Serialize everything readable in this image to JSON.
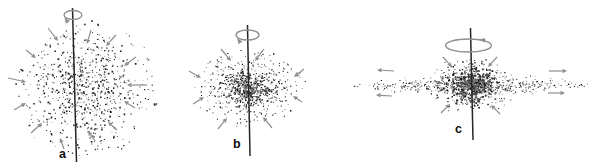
{
  "canvas": {
    "width": 601,
    "height": 168,
    "background": "#ffffff"
  },
  "colors": {
    "particle_dark": "#141414",
    "particle_mid": "#3c3c3c",
    "particle_light": "#757575",
    "arrow": "#8e8e8e",
    "axis": "#262626",
    "label": "#0f0f0f"
  },
  "panels": [
    {
      "label": "a",
      "label_pos": {
        "x": 59,
        "y": 158
      },
      "axis": {
        "x1": 72.5,
        "y1": 8,
        "x2": 76.5,
        "y2": 162
      },
      "rotation": {
        "cx": 73,
        "cy": 15,
        "rx": 9,
        "ry": 4.5,
        "head": {
          "x": 64.5,
          "y": 17.5,
          "rot": 235
        }
      },
      "clusters": [
        {
          "cx": 85,
          "cy": 88,
          "sx": 30,
          "sy": 27,
          "n": 620,
          "rx": 76,
          "ry": 68,
          "smin": 0.7,
          "smax": 1.7
        },
        {
          "cx": 85,
          "cy": 88,
          "sx": 44,
          "sy": 40,
          "n": 240,
          "rx": 77,
          "ry": 69,
          "smin": 0.6,
          "smax": 1.3
        }
      ],
      "infall_arrows": [
        [
          48,
          28,
          58,
          41
        ],
        [
          91,
          30,
          87,
          44
        ],
        [
          116,
          35,
          106,
          46
        ],
        [
          26,
          50,
          36,
          58
        ],
        [
          136,
          57,
          124,
          66
        ],
        [
          8,
          78,
          26,
          82
        ],
        [
          147,
          85,
          127,
          85
        ],
        [
          14,
          110,
          26,
          103
        ],
        [
          135,
          108,
          124,
          101
        ],
        [
          31,
          133,
          42,
          123
        ],
        [
          117,
          130,
          108,
          122
        ],
        [
          95,
          141,
          88,
          131
        ],
        [
          64,
          149,
          60,
          138
        ]
      ],
      "outflow_arrows": []
    },
    {
      "label": "b",
      "label_pos": {
        "x": 233,
        "y": 148
      },
      "axis": {
        "x1": 247.5,
        "y1": 25,
        "x2": 250,
        "y2": 156
      },
      "rotation": {
        "cx": 247.5,
        "cy": 35,
        "rx": 11.5,
        "ry": 5,
        "head": {
          "x": 237,
          "y": 38,
          "rot": 235
        }
      },
      "clusters": [
        {
          "cx": 248,
          "cy": 88,
          "sx": 12,
          "sy": 9,
          "n": 360,
          "rx": 57,
          "ry": 39,
          "smin": 0.8,
          "smax": 1.7
        },
        {
          "cx": 248,
          "cy": 88,
          "sx": 25,
          "sy": 17,
          "n": 400,
          "rx": 57,
          "ry": 39,
          "smin": 0.7,
          "smax": 1.4
        },
        {
          "cx": 248,
          "cy": 88,
          "sx": 37,
          "sy": 25,
          "n": 150,
          "rx": 58,
          "ry": 40,
          "smin": 0.6,
          "smax": 1.2
        }
      ],
      "infall_arrows": [
        [
          221,
          49,
          231,
          61
        ],
        [
          264,
          49,
          255,
          61
        ],
        [
          189,
          71,
          201,
          78
        ],
        [
          304,
          69,
          294,
          77
        ],
        [
          193,
          104,
          204,
          97
        ],
        [
          302,
          102,
          293,
          96
        ],
        [
          218,
          129,
          227,
          118
        ],
        [
          272,
          128,
          263,
          117
        ]
      ],
      "outflow_arrows": []
    },
    {
      "label": "c",
      "label_pos": {
        "x": 455,
        "y": 133
      },
      "axis": {
        "x1": 470.5,
        "y1": 28,
        "x2": 473,
        "y2": 140
      },
      "rotation": {
        "cx": 468.5,
        "cy": 45.5,
        "rx": 23,
        "ry": 6.5,
        "head": {
          "x": 479,
          "y": 39.5,
          "rot": 187
        }
      },
      "clusters": [
        {
          "cx": 472,
          "cy": 84,
          "sx": 11,
          "sy": 9,
          "n": 500,
          "rx": 32,
          "ry": 27,
          "smin": 0.9,
          "smax": 1.9
        },
        {
          "cx": 472,
          "cy": 85,
          "sx": 22,
          "sy": 13,
          "n": 280,
          "rx": 46,
          "ry": 30,
          "smin": 0.7,
          "smax": 1.5
        },
        {
          "cx": 472,
          "cy": 85.5,
          "sx": 42,
          "sy": 5,
          "n": 260,
          "rx": 118,
          "ry": 12,
          "smin": 0.6,
          "smax": 1.3
        },
        {
          "cx": 472,
          "cy": 85.5,
          "sx": 78,
          "sy": 2.8,
          "n": 300,
          "rx": 118,
          "ry": 9,
          "smin": 0.6,
          "smax": 1.3
        }
      ],
      "infall_arrows": [
        [
          443,
          57,
          452,
          67
        ],
        [
          497,
          57,
          488,
          67
        ],
        [
          441,
          113,
          450,
          104
        ],
        [
          500,
          114,
          491,
          105
        ]
      ],
      "outflow_arrows": [
        [
          394,
          71,
          377,
          70
        ],
        [
          392,
          96,
          376,
          95
        ],
        [
          549,
          71,
          567,
          71
        ],
        [
          548,
          93,
          565,
          93
        ]
      ]
    }
  ]
}
